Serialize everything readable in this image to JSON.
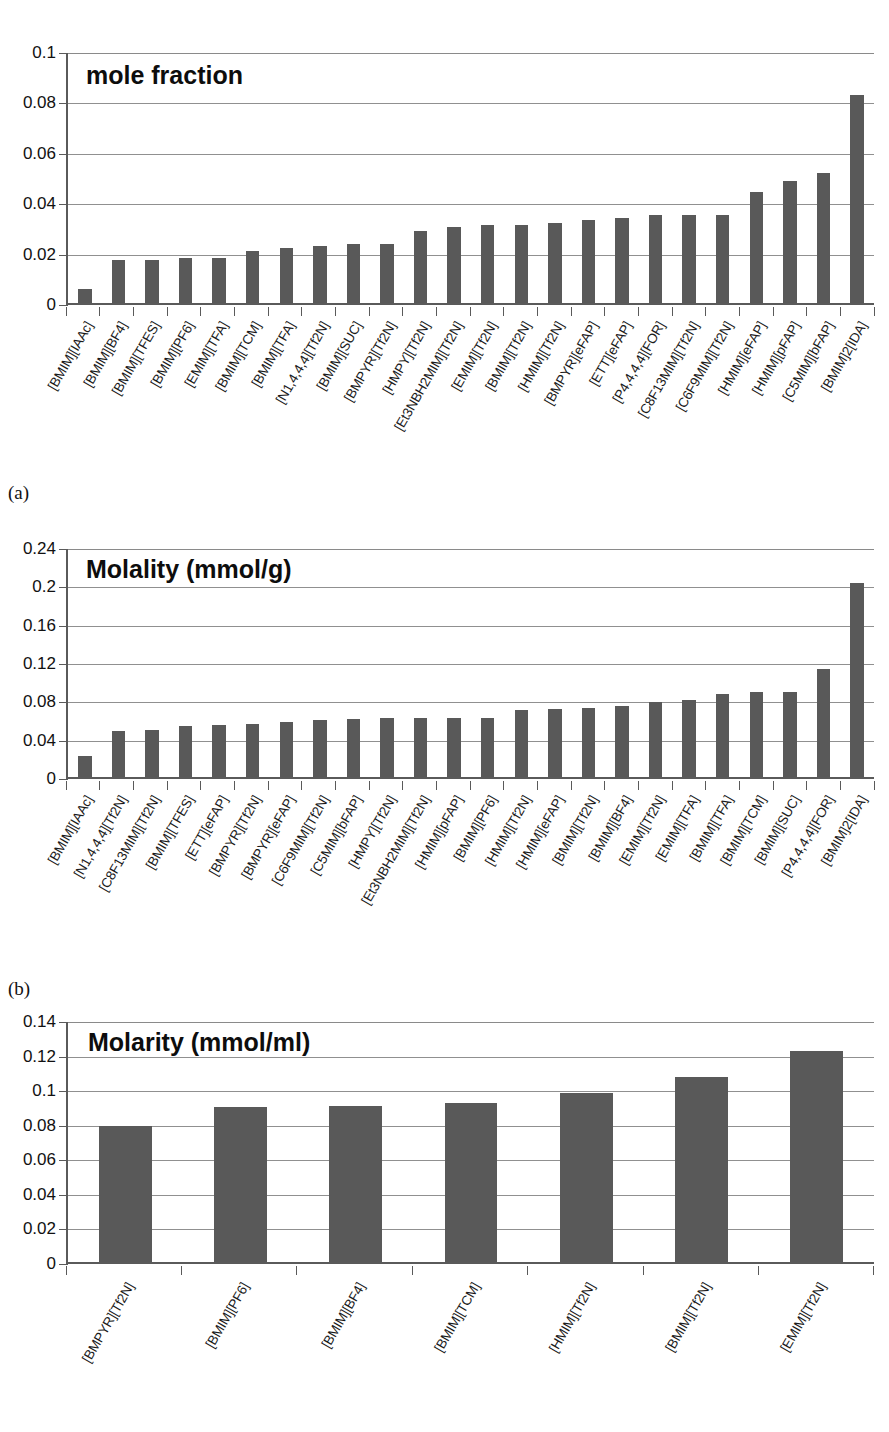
{
  "figure": {
    "background": "#ffffff",
    "bar_color": "#595959",
    "axis_color": "#5a5a5a",
    "grid_color": "#909090"
  },
  "panels": [
    {
      "letter": "(a)"
    },
    {
      "letter": "(b)"
    }
  ],
  "chart_data": [
    {
      "id": "chart-a",
      "type": "bar",
      "title": "mole fraction",
      "xlabel": "",
      "ylabel": "",
      "ylim": [
        0,
        0.1
      ],
      "ytick_labels": [
        "0",
        "0.02",
        "0.04",
        "0.06",
        "0.08",
        "0.1"
      ],
      "ytick_values": [
        0,
        0.02,
        0.04,
        0.06,
        0.08,
        0.1
      ],
      "grid": true,
      "legend": "none",
      "categories": [
        "[BMIM][IAAc]",
        "[BMIM][BF4]",
        "[BMIM][TFES]",
        "[BMIM][PF6]",
        "[EMIM][TFA]",
        "[BMIM][TCM]",
        "[BMIM][TFA]",
        "[N1,4,4,4][Tf2N]",
        "[BMIM][SUC]",
        "[BMPYR][Tf2N]",
        "[HMPY][Tf2N]",
        "[Et3NBH2MIM][Tf2N]",
        "[EMIM][Tf2N]",
        "[BMIM][Tf2N]",
        "[HMIM][Tf2N]",
        "[BMPYR][eFAP]",
        "[ETT][eFAP]",
        "[P4,4,4,4][FOR]",
        "[C8F13MIM][Tf2N]",
        "[C6F9MIM][Tf2N]",
        "[HMIM][eFAP]",
        "[HMIM][pFAP]",
        "[C5MIM][bFAP]",
        "[BMIM]2[IDA]"
      ],
      "values": [
        0.0056,
        0.017,
        0.0172,
        0.0179,
        0.018,
        0.0207,
        0.022,
        0.0228,
        0.0233,
        0.0236,
        0.0287,
        0.03,
        0.031,
        0.0311,
        0.0317,
        0.033,
        0.0336,
        0.0348,
        0.0349,
        0.0349,
        0.044,
        0.0483,
        0.0515,
        0.0824
      ]
    },
    {
      "id": "chart-b",
      "type": "bar",
      "title": "Molality (mmol/g)",
      "xlabel": "",
      "ylabel": "",
      "ylim": [
        0,
        0.24
      ],
      "ytick_labels": [
        "0",
        "0.04",
        "0.08",
        "0.12",
        "0.16",
        "0.2",
        "0.24"
      ],
      "ytick_values": [
        0,
        0.04,
        0.08,
        0.12,
        0.16,
        0.2,
        0.24
      ],
      "grid": true,
      "legend": "none",
      "categories": [
        "[BMIM][IAAc]",
        "[N1,4,4,4][Tf2N]",
        "[C8F13MIM][Tf2N]",
        "[BMIM][TFES]",
        "[ETT][eFAP]",
        "[BMPYR][Tf2N]",
        "[BMPYR][eFAP]",
        "[C6F9MIM][Tf2N]",
        "[C5MIM][bFAP]",
        "[HMPY][Tf2N]",
        "[Et3NBH2MIM][Tf2N]",
        "[HMIM][pFAP]",
        "[BMIM][PF6]",
        "[HMIM][Tf2N]",
        "[HMIM][eFAP]",
        "[BMIM][Tf2N]",
        "[BMIM][BF4]",
        "[EMIM][Tf2N]",
        "[EMIM][TFA]",
        "[BMIM][TFA]",
        "[BMIM][TCM]",
        "[BMIM][SUC]",
        "[P4,4,4,4][FOR]",
        "[BMIM]2[IDA]"
      ],
      "values": [
        0.0215,
        0.0475,
        0.0495,
        0.053,
        0.0545,
        0.0555,
        0.057,
        0.059,
        0.0605,
        0.0615,
        0.062,
        0.062,
        0.062,
        0.07,
        0.0705,
        0.0725,
        0.074,
        0.0785,
        0.0805,
        0.087,
        0.0885,
        0.089,
        0.113,
        0.202
      ]
    },
    {
      "id": "chart-c",
      "type": "bar",
      "title": "Molarity (mmol/ml)",
      "xlabel": "",
      "ylabel": "",
      "ylim": [
        0,
        0.14
      ],
      "ytick_labels": [
        "0",
        "0.02",
        "0.04",
        "0.06",
        "0.08",
        "0.1",
        "0.12",
        "0.14"
      ],
      "ytick_values": [
        0,
        0.02,
        0.04,
        0.06,
        0.08,
        0.1,
        0.12,
        0.14
      ],
      "grid": true,
      "legend": "none",
      "categories": [
        "[BMPYR][Tf2N]",
        "[BMIM][PF6]",
        "[BMIM][BF4]",
        "[BMIM][TCM]",
        "[HMIM][Tf2N]",
        "[BMIM][Tf2N]",
        "[EMIM][Tf2N]"
      ],
      "values": [
        0.0785,
        0.0895,
        0.0903,
        0.092,
        0.0978,
        0.1068,
        0.1218
      ]
    }
  ]
}
